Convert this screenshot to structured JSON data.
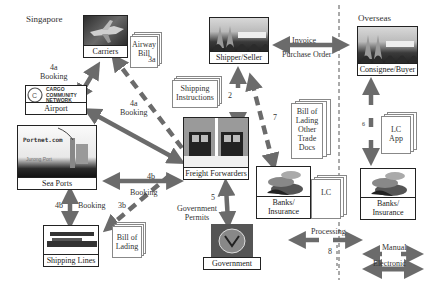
{
  "regions": {
    "local": "Singapore",
    "overseas": "Overseas"
  },
  "nodes": {
    "carriers": "Carriers",
    "airport": "Airport",
    "airport_logo": [
      "CARGO",
      "COMMUNITY",
      "NETWORK"
    ],
    "sea_ports": "Sea Ports",
    "sea_ports_logo": "Portnet.com",
    "sea_ports_caption": "Jurong Port",
    "shipping_lines": "Shipping Lines",
    "shipper": "Shipper/Seller",
    "freight": "Freight Forwarders",
    "government": "Government",
    "banks_local": "Banks/ Insurance",
    "consignee": "Consignee/Buyer",
    "banks_overseas": "Banks/ Insurance"
  },
  "documents": {
    "airway_bill": [
      "Airway",
      "Bill"
    ],
    "shipping_instructions": [
      "Shipping",
      "Instructions"
    ],
    "bill_of_lading_other": [
      "Bill of",
      "Lading",
      "Other",
      "Trade",
      "Docs"
    ],
    "bill_of_lading": [
      "Bill of",
      "Lading"
    ],
    "lc": "LC",
    "lc_app": [
      "LC",
      "App"
    ]
  },
  "flows": {
    "f2": "2",
    "f3a": "3a",
    "f3b": "3b",
    "f4a_num": "4a",
    "f4a_label": "Booking",
    "f4a2_num": "4a",
    "f4a2_label": "Booking",
    "f4b_num": "4b",
    "f4b_label": "Booking",
    "f4b2_num": "4b",
    "f4b2_label": "Booking",
    "f5_num": "5",
    "f5_label": [
      "Government",
      "Permits"
    ],
    "f6": "6",
    "f7": "7",
    "f8_num": "8",
    "f8_label": "Processing",
    "invoice": "Invoice",
    "purchase_order": "Purchase Order"
  },
  "legend": {
    "manual": "Manual",
    "electronic": "Electronic"
  },
  "colors": {
    "arrow": "#6b6b6b",
    "border": "#222222",
    "divider": "#555555"
  }
}
